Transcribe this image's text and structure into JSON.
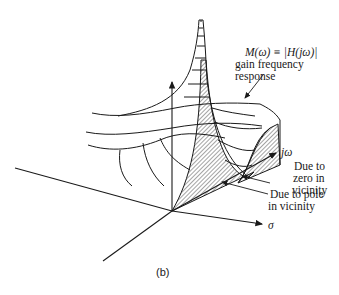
{
  "figure": {
    "caption": "(b)",
    "gain_label": {
      "formula": "M(ω) ≡ |H(jω)|",
      "line2": "gain frequency",
      "line3": "response"
    },
    "axis_labels": {
      "sigma": "σ",
      "jomega": "jω"
    },
    "annotations": {
      "zero": [
        "Due to",
        "zero in",
        "vicinity"
      ],
      "pole": [
        "Due to pole",
        "in vicinity"
      ]
    },
    "colors": {
      "ink": "#1a1a1a",
      "background": "#ffffff"
    }
  }
}
